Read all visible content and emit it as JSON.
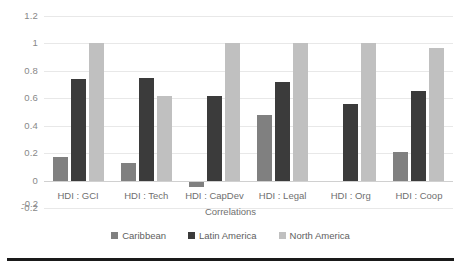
{
  "chart_data": {
    "type": "bar",
    "title": "",
    "xlabel": "Correlations",
    "ylabel": "",
    "categories": [
      "HDI : GCI",
      "HDI : Tech",
      "HDI : CapDev",
      "HDI : Legal",
      "HDI : Org",
      "HDI : Coop"
    ],
    "series": [
      {
        "name": "Caribbean",
        "color": "#808080",
        "values": [
          0.17,
          0.13,
          -0.05,
          0.48,
          0.0,
          0.21
        ]
      },
      {
        "name": "Latin America",
        "color": "#3b3b3b",
        "values": [
          0.74,
          0.75,
          0.62,
          0.72,
          0.56,
          0.65
        ]
      },
      {
        "name": "North America",
        "color": "#c0c0c0",
        "values": [
          1.0,
          0.62,
          1.0,
          1.0,
          1.0,
          0.97
        ]
      }
    ],
    "ylim": [
      -0.2,
      1.2
    ],
    "ytick_labels": [
      "1.2",
      "1",
      "0.8",
      "0.6",
      "0.4",
      "0.2",
      "0",
      "-0.2"
    ],
    "ytick_values": [
      1.2,
      1.0,
      0.8,
      0.6,
      0.4,
      0.2,
      0,
      -0.2
    ],
    "grid": true,
    "legend_position": "bottom"
  },
  "axis": {
    "x_title": "Correlations"
  }
}
